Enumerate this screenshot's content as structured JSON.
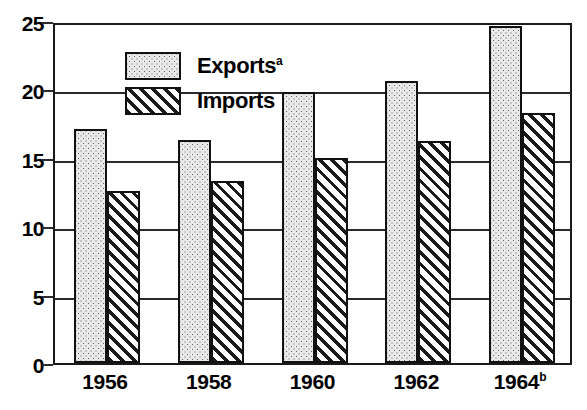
{
  "chart_data": {
    "type": "bar",
    "title": "",
    "xlabel": "",
    "ylabel": "",
    "categories": [
      "1956",
      "1958",
      "1960",
      "1962",
      "1964"
    ],
    "category_labels": [
      {
        "text": "1956",
        "superscript": ""
      },
      {
        "text": "1958",
        "superscript": ""
      },
      {
        "text": "1960",
        "superscript": ""
      },
      {
        "text": "1962",
        "superscript": ""
      },
      {
        "text": "1964",
        "superscript": "b"
      }
    ],
    "series": [
      {
        "name": "Exports",
        "superscript": "a",
        "pattern": "dotted",
        "fill_color": "#e9e9e9",
        "values": [
          17.1,
          16.3,
          19.8,
          20.6,
          24.6
        ]
      },
      {
        "name": "Imports",
        "superscript": "",
        "pattern": "diagonal-hatch",
        "fill_color": "#ffffff",
        "values": [
          12.6,
          13.3,
          15.0,
          16.2,
          18.3
        ]
      }
    ],
    "ylim": [
      0,
      25
    ],
    "yticks": [
      0,
      5,
      10,
      15,
      20,
      25
    ],
    "ytick_labels": [
      "0",
      "5",
      "10",
      "15",
      "20",
      "25"
    ],
    "grid": true,
    "grid_axis": "y",
    "legend_position": "top-left",
    "axis_color": "#1a1a1a"
  },
  "legend": {
    "items": [
      {
        "label": "Exports",
        "superscript": "a"
      },
      {
        "label": "Imports",
        "superscript": ""
      }
    ]
  }
}
